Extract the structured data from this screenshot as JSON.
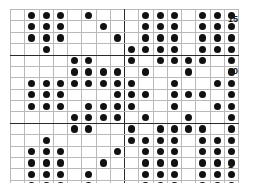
{
  "chart": {
    "caption": "",
    "type": "stitch-chart-grid",
    "columns": 16,
    "rows": 16,
    "dot_color": "#111111",
    "grid_line_color": "#b9b9b9",
    "border_color": "#2b2b2b",
    "row_labels": [
      {
        "text": "15",
        "row_index": 1
      },
      {
        "text": "10",
        "row_index": 6
      },
      {
        "text": "1",
        "row_index": 15
      }
    ]
  },
  "chart_data": {
    "type": "heatmap",
    "title": "",
    "xlabel": "",
    "ylabel": "",
    "grid": true,
    "legend": "none",
    "columns": 16,
    "rows": 16,
    "x": [
      1,
      2,
      3,
      4,
      5,
      6,
      7,
      8,
      9,
      10,
      11,
      12,
      13,
      14,
      15,
      16
    ],
    "row_tick_labels": [
      "15",
      "10",
      "1"
    ],
    "row_tick_rows": [
      16,
      11,
      1
    ],
    "values": [
      [
        0,
        1,
        1,
        1,
        0,
        1,
        0,
        0,
        0,
        1,
        1,
        1,
        0,
        1,
        1,
        1
      ],
      [
        0,
        1,
        1,
        1,
        0,
        0,
        1,
        0,
        0,
        1,
        1,
        1,
        0,
        1,
        1,
        1
      ],
      [
        0,
        1,
        1,
        1,
        0,
        0,
        0,
        1,
        0,
        1,
        1,
        1,
        0,
        1,
        1,
        1
      ],
      [
        0,
        0,
        1,
        0,
        0,
        0,
        0,
        0,
        1,
        1,
        1,
        1,
        0,
        1,
        1,
        1
      ],
      [
        0,
        0,
        0,
        0,
        1,
        1,
        0,
        0,
        1,
        0,
        1,
        1,
        1,
        1,
        0,
        1
      ],
      [
        0,
        0,
        0,
        0,
        1,
        1,
        1,
        1,
        0,
        1,
        0,
        0,
        1,
        0,
        0,
        1
      ],
      [
        0,
        1,
        1,
        1,
        1,
        1,
        1,
        1,
        1,
        0,
        0,
        1,
        0,
        0,
        1,
        1
      ],
      [
        0,
        1,
        1,
        1,
        0,
        0,
        0,
        1,
        1,
        1,
        0,
        1,
        1,
        1,
        0,
        1
      ],
      [
        0,
        1,
        1,
        1,
        0,
        1,
        1,
        1,
        1,
        0,
        0,
        1,
        0,
        0,
        1,
        1
      ],
      [
        0,
        0,
        0,
        0,
        1,
        1,
        1,
        1,
        0,
        1,
        0,
        0,
        1,
        0,
        0,
        1
      ],
      [
        0,
        0,
        0,
        0,
        1,
        1,
        0,
        0,
        1,
        0,
        1,
        1,
        1,
        1,
        0,
        1
      ],
      [
        0,
        0,
        1,
        0,
        0,
        0,
        0,
        0,
        1,
        1,
        1,
        1,
        0,
        1,
        1,
        1
      ],
      [
        0,
        1,
        1,
        1,
        0,
        0,
        0,
        1,
        0,
        1,
        1,
        1,
        0,
        1,
        1,
        1
      ],
      [
        0,
        1,
        1,
        1,
        0,
        0,
        1,
        0,
        0,
        1,
        1,
        1,
        0,
        1,
        1,
        1
      ],
      [
        0,
        1,
        1,
        1,
        0,
        1,
        0,
        0,
        0,
        1,
        1,
        1,
        0,
        1,
        1,
        1
      ],
      [
        0,
        1,
        1,
        1,
        0,
        1,
        0,
        0,
        0,
        1,
        1,
        1,
        0,
        1,
        1,
        1
      ]
    ],
    "bold_row_separators_after": [
      4,
      10
    ],
    "bold_col_separators_after": [
      8
    ]
  }
}
